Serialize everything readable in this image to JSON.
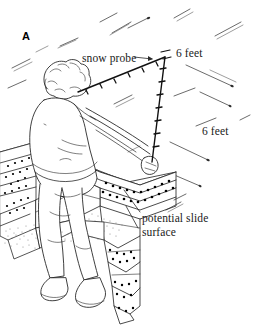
{
  "figure": {
    "panel_letter": "A",
    "labels": {
      "snow_probe": "snow probe",
      "six_feet_top": "6 feet",
      "six_feet_right": "6 feet",
      "slide_surface_line1": "potential slide",
      "slide_surface_line2": "surface"
    },
    "colors": {
      "ink": "#1a1a1a",
      "line": "#333333",
      "background": "#ffffff",
      "stipple": "#000000"
    },
    "scene": {
      "description": "Line drawing of a person standing at a snow pit inserting a snow probe, measuring a 6 foot by 6 foot square, with labelled snow stratigraphy layers.",
      "probe_segment_count": 2,
      "probe_horizontal_length_label": "6 feet",
      "probe_vertical_length_label": "6 feet"
    }
  }
}
